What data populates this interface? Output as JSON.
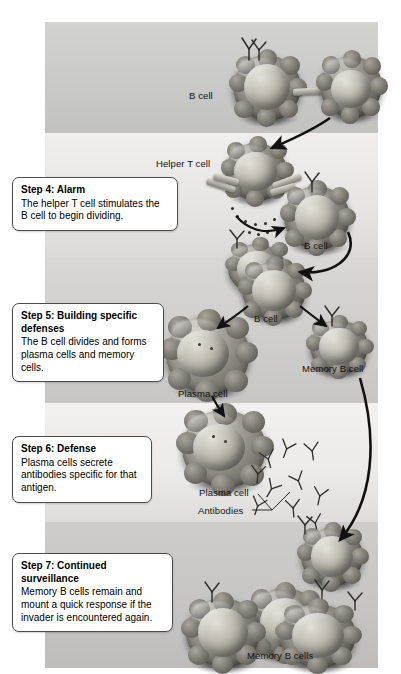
{
  "figure": {
    "panel_bands": 5
  },
  "steps": [
    {
      "id": "step4",
      "title": "Step 4: Alarm",
      "body": "The helper T cell stimulates the B cell to begin dividing."
    },
    {
      "id": "step5",
      "title": "Step 5: Building specific defenses",
      "body": "The B cell divides and forms plasma cells and memory cells."
    },
    {
      "id": "step6",
      "title": "Step 6: Defense",
      "body": "Plasma cells secrete antibodies specific for that antigen."
    },
    {
      "id": "step7",
      "title": "Step 7: Continued surveillance",
      "body": "Memory B cells remain and mount a quick response if the invader is encountered again."
    }
  ],
  "labels": {
    "b_cell_top": "B cell",
    "helper_t_cell": "Helper T cell",
    "b_cell_step4": "B cell",
    "b_cell_step5": "B cell",
    "memory_b_cell": "Memory B cell",
    "plasma_cell_step5": "Plasma cell",
    "plasma_cell_step6": "Plasma cell",
    "antibodies": "Antibodies",
    "memory_b_cells": "Memory B cells"
  },
  "colors": {
    "page_background": "#ffffff",
    "band_dark": "#c9c9c8",
    "band_light": "#eceae8",
    "cell_membrane": "#8e8a82",
    "cell_nucleus": "#c3bfb5",
    "callout_border": "#4c4c4c",
    "callout_fill": "#ffffff",
    "text": "#111111",
    "arrow": "#1a1a1a"
  },
  "icons": {
    "antibody": "antibody-y-shape",
    "receptor": "receptor-y-shape",
    "t_receptor": "t-cell-tube-receptor",
    "cytokine": "cytokine-dot",
    "arrow": "process-arrow"
  }
}
